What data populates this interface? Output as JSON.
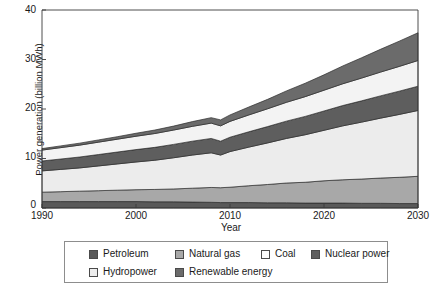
{
  "chart_data": {
    "type": "area",
    "title": "",
    "xlabel": "Year",
    "ylabel": "Power generation (billion MWh)",
    "stacked": true,
    "grid": false,
    "legend_position": "bottom",
    "xlim": [
      1990,
      2030
    ],
    "ylim": [
      0,
      40
    ],
    "xticks": [
      1990,
      2000,
      2010,
      2020,
      2030
    ],
    "yticks": [
      0,
      10,
      20,
      30,
      40
    ],
    "x": [
      1990,
      1992,
      1994,
      1996,
      1998,
      2000,
      2002,
      2004,
      2006,
      2008,
      2009,
      2010,
      2012,
      2014,
      2016,
      2018,
      2020,
      2022,
      2024,
      2026,
      2028,
      2030
    ],
    "series": [
      {
        "name": "Petroleum",
        "color": "#595959",
        "values": [
          1.3,
          1.3,
          1.3,
          1.3,
          1.3,
          1.3,
          1.25,
          1.25,
          1.2,
          1.15,
          1.1,
          1.1,
          1.1,
          1.05,
          1.05,
          1.0,
          1.0,
          1.0,
          0.95,
          0.95,
          0.9,
          0.9
        ]
      },
      {
        "name": "Natural gas",
        "color": "#a8a8a8",
        "values": [
          1.9,
          2.0,
          2.1,
          2.2,
          2.3,
          2.4,
          2.5,
          2.6,
          2.8,
          3.0,
          3.0,
          3.1,
          3.4,
          3.7,
          4.0,
          4.2,
          4.5,
          4.7,
          4.9,
          5.1,
          5.3,
          5.5
        ]
      },
      {
        "name": "Coal",
        "color": "#ececec",
        "values": [
          4.3,
          4.5,
          4.7,
          5.0,
          5.3,
          5.6,
          5.9,
          6.3,
          6.7,
          7.0,
          6.6,
          7.2,
          7.8,
          8.4,
          9.0,
          9.6,
          10.2,
          10.9,
          11.5,
          12.1,
          12.7,
          13.3
        ]
      },
      {
        "name": "Nuclear power",
        "color": "#5e5e5e",
        "values": [
          2.0,
          2.1,
          2.2,
          2.3,
          2.4,
          2.5,
          2.6,
          2.7,
          2.8,
          2.9,
          2.8,
          2.9,
          3.1,
          3.3,
          3.5,
          3.7,
          3.9,
          4.1,
          4.3,
          4.5,
          4.7,
          4.9
        ]
      },
      {
        "name": "Hydropower",
        "color": "#f3f3f3",
        "values": [
          2.2,
          2.3,
          2.4,
          2.5,
          2.6,
          2.7,
          2.8,
          2.9,
          3.0,
          3.1,
          3.1,
          3.2,
          3.4,
          3.6,
          3.8,
          4.0,
          4.2,
          4.4,
          4.6,
          4.8,
          5.0,
          5.2
        ]
      },
      {
        "name": "Renewable energy",
        "color": "#6b6b6b",
        "values": [
          0.3,
          0.35,
          0.4,
          0.45,
          0.5,
          0.6,
          0.7,
          0.8,
          0.95,
          1.1,
          1.2,
          1.3,
          1.6,
          1.9,
          2.3,
          2.7,
          3.1,
          3.6,
          4.1,
          4.6,
          5.1,
          5.6
        ]
      }
    ],
    "totals": [
      12.0,
      12.55,
      13.1,
      13.75,
      14.4,
      15.1,
      15.75,
      16.55,
      17.45,
      18.25,
      17.8,
      18.8,
      20.4,
      21.95,
      23.65,
      25.2,
      26.9,
      28.7,
      30.35,
      32.05,
      33.7,
      35.4
    ]
  },
  "axes": {
    "ylabel": "Power generation (billion MWh)",
    "xlabel": "Year",
    "yticks": [
      "0",
      "10",
      "20",
      "30",
      "40"
    ],
    "xticks": [
      "1990",
      "2000",
      "2010",
      "2020",
      "2030"
    ]
  },
  "legend": {
    "entries": [
      {
        "label": "Petroleum",
        "color": "#595959"
      },
      {
        "label": "Natural gas",
        "color": "#a8a8a8"
      },
      {
        "label": "Coal",
        "color": "#fbfbfb"
      },
      {
        "label": "Nuclear power",
        "color": "#5e5e5e"
      },
      {
        "label": "Hydropower",
        "color": "#ededed"
      },
      {
        "label": "Renewable energy",
        "color": "#6b6b6b"
      }
    ]
  }
}
